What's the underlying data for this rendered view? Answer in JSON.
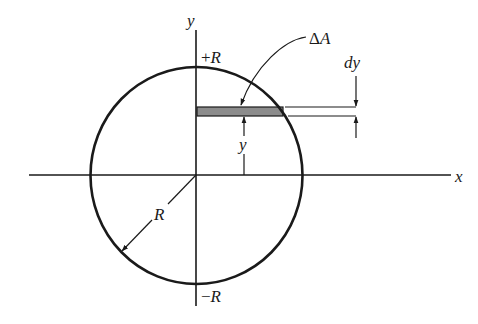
{
  "diagram": {
    "type": "geometry-figure",
    "colors": {
      "stroke": "#1a1a1a",
      "strip_fill": "#8c8c8c",
      "background": "#ffffff"
    },
    "axes": {
      "x_label": "x",
      "y_label": "y"
    },
    "circle": {
      "top_label_sign": "+",
      "top_label_var": "R",
      "bottom_label_sign": "−",
      "bottom_label_var": "R",
      "radius_label": "R"
    },
    "strip": {
      "area_label_delta": "Δ",
      "area_label_var": "A",
      "thickness_label": "dy",
      "height_label": "y"
    }
  }
}
